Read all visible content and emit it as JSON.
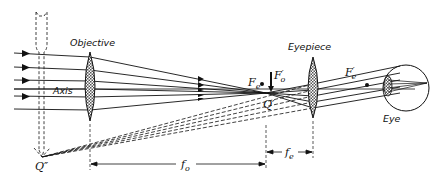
{
  "diagram": {
    "type": "optical ray diagram — astronomical telescope",
    "labels": {
      "objective": "Objective",
      "eyepiece": "Eyepiece",
      "axis": "Axis",
      "eye": "Eye",
      "fe_point": "F",
      "fe_sub": "e",
      "fo_prime": "F",
      "fo_prime_sub": "o",
      "fo_prime_mark": "′",
      "fe_prime": "F",
      "fe_prime_sub": "e",
      "fe_prime_mark": "′",
      "q_prime": "Q′",
      "q_double_prime": "Q″",
      "f_o": "f",
      "f_o_sub": "o",
      "f_e": "f",
      "f_e_sub": "e"
    },
    "components": [
      {
        "name": "objective-lens",
        "x": 90
      },
      {
        "name": "eyepiece-lens",
        "x": 313
      },
      {
        "name": "eye",
        "x": 406
      }
    ],
    "dimensions": [
      {
        "name": "focal-length-objective",
        "label": "f_o"
      },
      {
        "name": "focal-length-eyepiece",
        "label": "f_e"
      }
    ],
    "colors": {
      "ink": "#111111",
      "lens_fill": "#9a9a9a"
    }
  }
}
